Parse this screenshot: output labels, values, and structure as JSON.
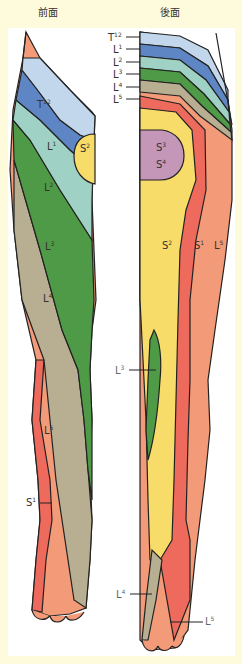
{
  "titles": {
    "front": "前面",
    "back": "後面"
  },
  "colors": {
    "background": "#fdfbdc",
    "T12": "#c3d7ec",
    "L1": "#5f86c4",
    "L2": "#9fd2c4",
    "L3": "#4f9a47",
    "L4": "#b8ae92",
    "L5": "#f39a78",
    "S1": "#ee6a5c",
    "S2": "#f8dc6a",
    "S3S4": "#c496b8",
    "outline": "#222222",
    "label_dark": "#333333",
    "label_gray": "#666666"
  },
  "front_labels": [
    {
      "text": "T12",
      "base": "T",
      "sup": "12"
    },
    {
      "text": "L1",
      "base": "L",
      "sup": "1"
    },
    {
      "text": "S2",
      "base": "S",
      "sup": "2"
    },
    {
      "text": "L2",
      "base": "L",
      "sup": "2"
    },
    {
      "text": "L3",
      "base": "L",
      "sup": "3"
    },
    {
      "text": "L4",
      "base": "L",
      "sup": "4"
    },
    {
      "text": "L5",
      "base": "L",
      "sup": "5"
    },
    {
      "text": "S1",
      "base": "S",
      "sup": "1"
    }
  ],
  "back_labels": [
    {
      "text": "T12",
      "base": "T",
      "sup": "12"
    },
    {
      "text": "L1",
      "base": "L",
      "sup": "1"
    },
    {
      "text": "L2",
      "base": "L",
      "sup": "2"
    },
    {
      "text": "L3",
      "base": "L",
      "sup": "3"
    },
    {
      "text": "L4",
      "base": "L",
      "sup": "4"
    },
    {
      "text": "L5",
      "base": "L",
      "sup": "5"
    },
    {
      "text": "S3",
      "base": "S",
      "sup": "3"
    },
    {
      "text": "S4",
      "base": "S",
      "sup": "4"
    },
    {
      "text": "S2",
      "base": "S",
      "sup": "2"
    },
    {
      "text": "S1",
      "base": "S",
      "sup": "1"
    },
    {
      "text": "L5",
      "base": "L",
      "sup": "5"
    },
    {
      "text": "L3",
      "base": "L",
      "sup": "3"
    },
    {
      "text": "L4",
      "base": "L",
      "sup": "4"
    },
    {
      "text": "L5",
      "base": "L",
      "sup": "5"
    }
  ]
}
